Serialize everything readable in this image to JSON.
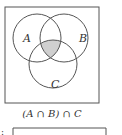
{
  "diagram": {
    "type": "venn",
    "sets": [
      {
        "label": "A"
      },
      {
        "label": "B"
      },
      {
        "label": "C"
      }
    ],
    "shaded_region": "A ∩ B ∩ C",
    "caption": "(A ∩ B) ∩ C",
    "colors": {
      "stroke": "#555555",
      "shade": "#cfcfcf",
      "background": "#ffffff"
    }
  },
  "next_item": {
    "marker": ":"
  }
}
